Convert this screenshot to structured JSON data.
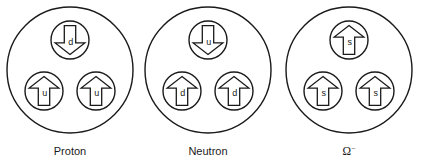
{
  "figure": {
    "background_color": "#ffffff",
    "stroke_color": "#1a1a1a",
    "width": 423,
    "height": 166
  },
  "particles": [
    {
      "name": "proton",
      "caption": "Proton",
      "caption_style": "plain",
      "center_x": 70,
      "center_y": 70,
      "radius": 63,
      "caption_x": 70,
      "caption_y": 155,
      "quarks": [
        {
          "flavor": "d",
          "spin": "down",
          "cx": 70,
          "cy": 40,
          "r": 19
        },
        {
          "flavor": "u",
          "spin": "up",
          "cx": 44,
          "cy": 91,
          "r": 19
        },
        {
          "flavor": "u",
          "spin": "up",
          "cx": 96,
          "cy": 91,
          "r": 19
        }
      ]
    },
    {
      "name": "neutron",
      "caption": "Neutron",
      "caption_style": "plain",
      "center_x": 208,
      "center_y": 70,
      "radius": 63,
      "caption_x": 208,
      "caption_y": 155,
      "quarks": [
        {
          "flavor": "u",
          "spin": "down",
          "cx": 208,
          "cy": 40,
          "r": 19
        },
        {
          "flavor": "d",
          "spin": "up",
          "cx": 182,
          "cy": 91,
          "r": 19
        },
        {
          "flavor": "d",
          "spin": "up",
          "cx": 234,
          "cy": 91,
          "r": 19
        }
      ]
    },
    {
      "name": "omega-minus",
      "caption": "Ω",
      "caption_charge": "−",
      "caption_style": "symbolic",
      "center_x": 349,
      "center_y": 70,
      "radius": 63,
      "caption_x": 349,
      "caption_y": 155,
      "quarks": [
        {
          "flavor": "s",
          "spin": "up",
          "cx": 349,
          "cy": 40,
          "r": 19
        },
        {
          "flavor": "s",
          "spin": "up",
          "cx": 323,
          "cy": 91,
          "r": 19
        },
        {
          "flavor": "s",
          "spin": "up",
          "cx": 375,
          "cy": 91,
          "r": 19
        }
      ]
    }
  ]
}
